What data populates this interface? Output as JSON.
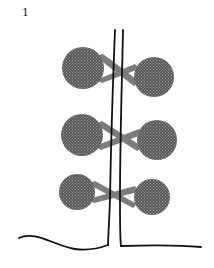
{
  "figure": {
    "label": "1",
    "colors": {
      "stem": "#111111",
      "bulb_fill": "#6a6a6a",
      "band_fill": "#7c7c7c",
      "background": "#ffffff"
    },
    "pairs": [
      {
        "left": {
          "cx": 83,
          "cy": 68,
          "r": 21
        },
        "right": {
          "cx": 154,
          "cy": 77,
          "r": 20
        }
      },
      {
        "left": {
          "cx": 82,
          "cy": 135,
          "r": 21
        },
        "right": {
          "cx": 157,
          "cy": 140,
          "r": 20
        }
      },
      {
        "left": {
          "cx": 77,
          "cy": 192,
          "r": 18
        },
        "right": {
          "cx": 152,
          "cy": 197,
          "r": 18
        }
      }
    ]
  }
}
